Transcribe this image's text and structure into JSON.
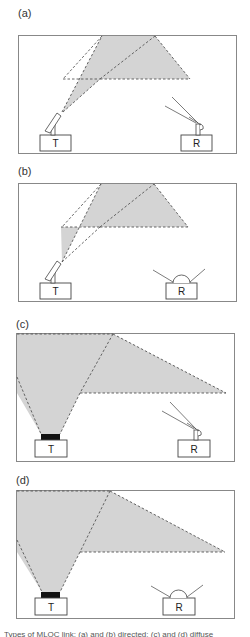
{
  "figure": {
    "panels": [
      {
        "id": "a",
        "label": "(a)",
        "transmitter": {
          "label": "T",
          "type": "directed"
        },
        "receiver": {
          "label": "R",
          "type": "directed"
        }
      },
      {
        "id": "b",
        "label": "(b)",
        "transmitter": {
          "label": "T",
          "type": "directed"
        },
        "receiver": {
          "label": "R",
          "type": "wide-angle"
        }
      },
      {
        "id": "c",
        "label": "(c)",
        "transmitter": {
          "label": "T",
          "type": "diffuse"
        },
        "receiver": {
          "label": "R",
          "type": "directed"
        }
      },
      {
        "id": "d",
        "label": "(d)",
        "transmitter": {
          "label": "T",
          "type": "diffuse"
        },
        "receiver": {
          "label": "R",
          "type": "wide-angle"
        }
      }
    ],
    "caption": "Types of MLOC link: (a) and (b) directed; (c) and (d) diffuse",
    "colors": {
      "beam_fill": "#d4d4d4",
      "beam_edge": "#555555",
      "frame": "#888888",
      "emitter": "#111111"
    }
  }
}
